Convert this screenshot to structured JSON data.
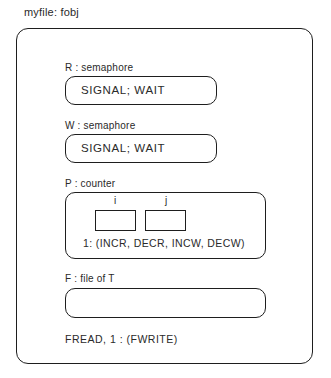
{
  "title": "myfile: fobj",
  "components": [
    {
      "label": "R : semaphore",
      "content": "SIGNAL; WAIT"
    },
    {
      "label": "W : semaphore",
      "content": "SIGNAL; WAIT"
    },
    {
      "label": "P : counter",
      "fields": [
        "i",
        "j"
      ],
      "content": "1: (INCR, DECR, INCW, DECW)"
    },
    {
      "label": "F : file of T",
      "content": ""
    }
  ],
  "footer": "FREAD, 1 : (FWRITE)"
}
